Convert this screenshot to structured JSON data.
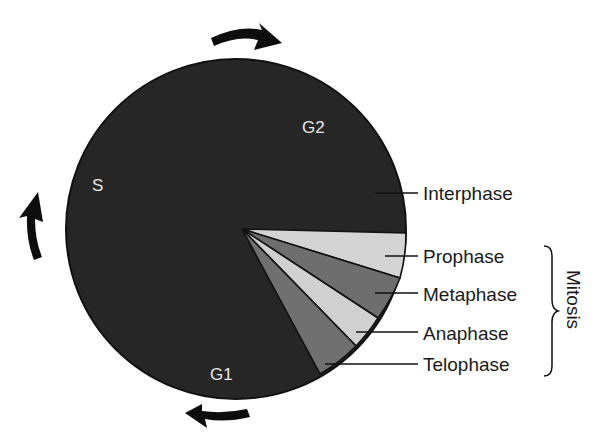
{
  "circle_labels": {
    "g2": "G2",
    "s": "S",
    "g1": "G1"
  },
  "phase_labels": {
    "interphase": "Interphase",
    "prophase": "Prophase",
    "metaphase": "Metaphase",
    "anaphase": "Anaphase",
    "telophase": "Telophase"
  },
  "group_label": "Mitosis",
  "colors": {
    "interphase": "#262626",
    "prophase": "#d4d4d4",
    "metaphase": "#6e6e6e",
    "anaphase": "#d0d0d0",
    "telophase": "#707070",
    "outline": "#111111",
    "arrow": "#0d0d0d"
  },
  "arrows": [
    "clockwise-arrow-top",
    "clockwise-arrow-left",
    "clockwise-arrow-bottom"
  ]
}
